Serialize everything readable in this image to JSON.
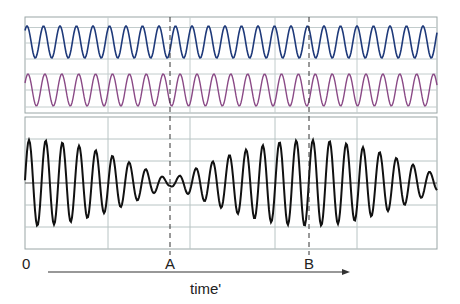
{
  "chart_data": {
    "type": "line",
    "title": "",
    "xlabel": "time'",
    "ylabel": "",
    "grid": true,
    "legend": null,
    "x_tick_labels": [
      "0",
      "A",
      "B"
    ],
    "markers": [
      {
        "label": "A",
        "description": "dashed vertical line at beat minimum (destructive interference)",
        "x_px": 170
      },
      {
        "label": "B",
        "description": "dashed vertical line at beat maximum (constructive interference)",
        "x_px": 309
      }
    ],
    "panels": [
      {
        "name": "upper",
        "series": [
          {
            "name": "wave 1",
            "color": "#1f3a7a",
            "shape": "sine",
            "amplitude_rel": 1.0,
            "period_px": 16.5,
            "constant_amplitude": true
          },
          {
            "name": "wave 2",
            "color": "#8a4a86",
            "shape": "sine",
            "amplitude_rel": 1.0,
            "period_px": 16.9,
            "constant_amplitude": true
          }
        ]
      },
      {
        "name": "lower",
        "series": [
          {
            "name": "superposition (beats)",
            "color": "#111111",
            "shape": "amplitude-modulated sine",
            "carrier_period_px": 16.7,
            "envelope_min_at": "A",
            "envelope_max_at": "B",
            "beat_period_px": 278
          }
        ]
      }
    ],
    "axis_arrow": {
      "label": "time'",
      "direction": "right"
    }
  },
  "labels": {
    "origin": "0",
    "a": "A",
    "b": "B",
    "time": "time'"
  },
  "colors": {
    "grid": "#b8c4c4",
    "panel_border": "#9aa6a6",
    "wave1": "#1f3a7a",
    "wave2": "#8a4a86",
    "beat": "#111111",
    "dashed": "#333333",
    "axis_arrow": "#333333"
  }
}
